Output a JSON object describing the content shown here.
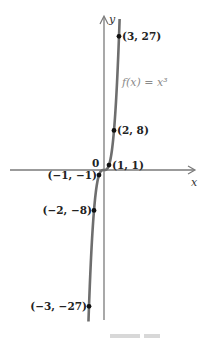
{
  "chart_data": {
    "type": "line",
    "title": "",
    "function_label": "f(x) = x³",
    "xlabel": "x",
    "ylabel": "y",
    "origin_label": "0",
    "grid": false,
    "legend": "none",
    "xlim": [
      -19,
      18
    ],
    "ylim": [
      -30,
      31
    ],
    "series": [
      {
        "name": "f(x) = x³",
        "x": [
          -3,
          -2,
          -1,
          0,
          1,
          2,
          3
        ],
        "y": [
          -27,
          -8,
          -1,
          0,
          1,
          8,
          27
        ]
      }
    ],
    "annotations": [
      {
        "x": 3,
        "y": 27,
        "text": "(3, 27)",
        "side": "right"
      },
      {
        "x": 2,
        "y": 8,
        "text": "(2, 8)",
        "side": "right"
      },
      {
        "x": 1,
        "y": 1,
        "text": "(1, 1)",
        "side": "right"
      },
      {
        "x": -1,
        "y": -1,
        "text": "(−1, −1)",
        "side": "left"
      },
      {
        "x": -2,
        "y": -8,
        "text": "(−2, −8)",
        "side": "left"
      },
      {
        "x": -3,
        "y": -27,
        "text": "(−3, −27)",
        "side": "left"
      }
    ],
    "colors": {
      "curve": "#6e6e6e",
      "axes": "#7a7a7a",
      "points": "#111111"
    }
  }
}
